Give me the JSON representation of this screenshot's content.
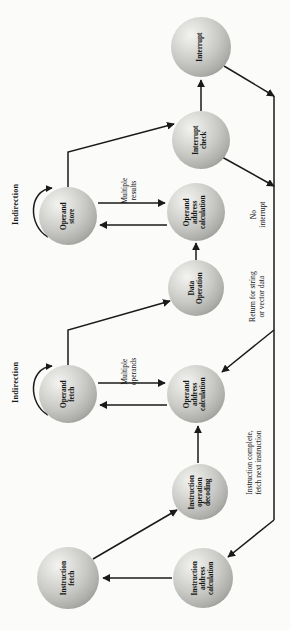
{
  "figure": {
    "orientation": "rotated-90-ccw",
    "background_color": "#fbfbfa",
    "node_fill": "#c8c8c4",
    "stroke_color": "#1a1a1a"
  },
  "nodes": [
    {
      "id": "interrupt",
      "label": "Interrupt",
      "cx": 201,
      "cy": 47,
      "r": 30
    },
    {
      "id": "interrupt-check",
      "label": "Interrupt\ncheck",
      "cx": 201,
      "cy": 140,
      "r": 29
    },
    {
      "id": "operand-store",
      "label": "Operand\nstore",
      "cx": 68,
      "cy": 216,
      "r": 29
    },
    {
      "id": "operand-addr-1",
      "label": "Operand\naddress\ncalculation",
      "cx": 196,
      "cy": 212,
      "r": 29
    },
    {
      "id": "data-operation",
      "label": "Data\nOperation",
      "cx": 196,
      "cy": 288,
      "r": 28
    },
    {
      "id": "operand-fetch",
      "label": "Operand\nfetch",
      "cx": 68,
      "cy": 394,
      "r": 29
    },
    {
      "id": "operand-addr-2",
      "label": "Operand\naddress\ncalculation",
      "cx": 196,
      "cy": 394,
      "r": 29
    },
    {
      "id": "instr-op-decode",
      "label": "Instruction\noperation\ndecoding",
      "cx": 200,
      "cy": 492,
      "r": 28
    },
    {
      "id": "instruction-fetch",
      "label": "Instruction\nfetch",
      "cx": 68,
      "cy": 578,
      "r": 31
    },
    {
      "id": "instr-addr-calc",
      "label": "Instruction\naddress\ncalculation",
      "cx": 203,
      "cy": 578,
      "r": 30
    }
  ],
  "edge_labels": [
    {
      "id": "indirection-store",
      "text": "Indirection",
      "x": 16,
      "y": 205,
      "bold": true
    },
    {
      "id": "indirection-fetch",
      "text": "Indirection",
      "x": 16,
      "y": 383,
      "bold": true
    },
    {
      "id": "multiple-results",
      "text": "Multiple\nresults",
      "x": 128,
      "y": 188,
      "bold": false
    },
    {
      "id": "multiple-operands",
      "text": "Multiple\noperands",
      "x": 128,
      "y": 369,
      "bold": false
    },
    {
      "id": "no-interrupt",
      "text": "No\ninterrupt",
      "x": 258,
      "y": 212,
      "bold": false
    },
    {
      "id": "return-string",
      "text": "Return for string\nor vector data",
      "x": 255,
      "y": 297,
      "bold": false
    },
    {
      "id": "instruction-complete",
      "text": "Instruction complete,\nfetch next instruction",
      "x": 254,
      "y": 463,
      "bold": false
    }
  ]
}
